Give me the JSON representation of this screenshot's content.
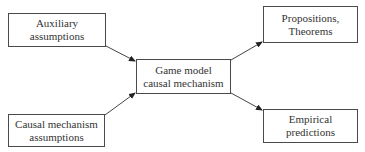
{
  "nodes": {
    "auxiliary": {
      "line1": "Auxiliary",
      "line2": "assumptions"
    },
    "causal": {
      "line1": "Causal mechanism",
      "line2": "assumptions"
    },
    "game_model": {
      "line1": "Game model",
      "line2": "causal mechanism"
    },
    "propositions": {
      "line1": "Propositions,",
      "line2": "Theorems"
    },
    "empirical": {
      "line1": "Empirical",
      "line2": "predictions"
    }
  },
  "edges": [
    {
      "from": "auxiliary",
      "to": "game_model"
    },
    {
      "from": "causal",
      "to": "game_model"
    },
    {
      "from": "game_model",
      "to": "propositions"
    },
    {
      "from": "game_model",
      "to": "empirical"
    }
  ]
}
